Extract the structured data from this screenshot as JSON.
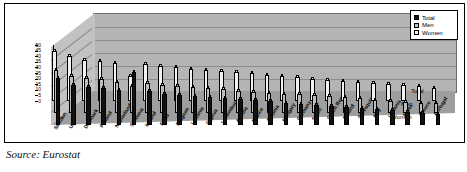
{
  "caption": "Source: Eurostat",
  "legend": {
    "items": [
      {
        "label": "Total",
        "color": "#111111"
      },
      {
        "label": "Men",
        "color": "#bdbdbd"
      },
      {
        "label": "Women",
        "color": "#f2f2f2"
      }
    ]
  },
  "depth_labels": [
    "Total",
    "Men",
    "Women"
  ],
  "chart_data": {
    "type": "bar",
    "title": "",
    "subtitle": "",
    "xlabel": "",
    "ylabel": "",
    "ylim": [
      0,
      50
    ],
    "yticks": [
      50,
      45,
      40,
      35,
      30,
      25,
      20,
      15,
      10,
      5,
      0
    ],
    "grid": true,
    "legend_position": "top-right",
    "projection": "3d-grouped-columns",
    "categories": [
      "Sweden",
      "UK",
      "Denmark",
      "Finland",
      "Netherlands",
      "Slovenia",
      "Ireland",
      "EU25",
      "Belgium",
      "Lettonie",
      "Cyprus",
      "Luxemburg",
      "Austria",
      "France",
      "Estonia",
      "Hungary",
      "Germany",
      "Spain",
      "Czech Rep.",
      "Poland",
      "Slovaquia",
      "Italy",
      "Lituania",
      "Malta",
      "Greece",
      "Portugal"
    ],
    "series": [
      {
        "name": "Total",
        "color": "#111111",
        "values": [
          42,
          36,
          34,
          33,
          31,
          47,
          30,
          28,
          27,
          26,
          25,
          24,
          23,
          22,
          21,
          20,
          19,
          18,
          17,
          16,
          15,
          14,
          13,
          12,
          11,
          10
        ]
      },
      {
        "name": "Men",
        "color": "#bdbdbd",
        "values": [
          38,
          33,
          31,
          30,
          28,
          24,
          27,
          25,
          24,
          23,
          22,
          21,
          20,
          19,
          18,
          17,
          17,
          16,
          15,
          14,
          13,
          12,
          11,
          10,
          9,
          9
        ]
      },
      {
        "name": "Women",
        "color": "#f2f2f2",
        "values": [
          45,
          40,
          37,
          36,
          34,
          22,
          33,
          31,
          30,
          29,
          28,
          27,
          26,
          25,
          23,
          22,
          21,
          20,
          19,
          18,
          17,
          16,
          15,
          14,
          13,
          12
        ]
      }
    ]
  }
}
